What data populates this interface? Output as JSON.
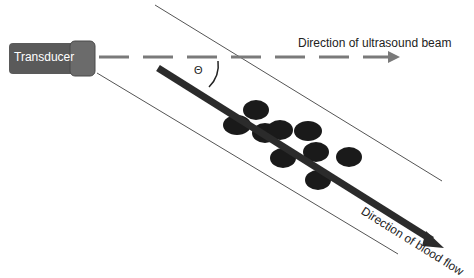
{
  "diagram": {
    "transducer": {
      "label": "Transducer",
      "body_color": "#5a5a5a",
      "cap_color": "#6b6b6b"
    },
    "beam": {
      "label": "Direction of ultrasound beam",
      "color": "#7a7a7a",
      "style": "dashed"
    },
    "flow": {
      "label": "Direction of blood flow",
      "color": "#2b2b2b"
    },
    "angle": {
      "symbol": "Θ"
    },
    "vessel": {
      "wall_color": "#555555"
    },
    "cells": {
      "count": 10,
      "color": "#1a1a1a"
    }
  }
}
